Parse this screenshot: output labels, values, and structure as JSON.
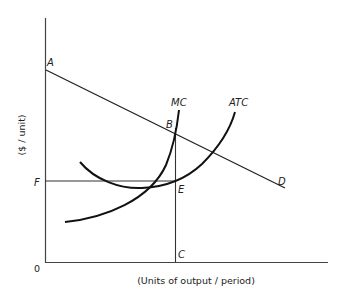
{
  "diagram": {
    "type": "economics-cost-curves",
    "y_axis_label": "($ / unit)",
    "x_axis_label": "(Units of output / period)",
    "origin_label": "0",
    "curves": {
      "demand": {
        "start_label": "A",
        "end_label": "D"
      },
      "mc": {
        "label": "MC"
      },
      "atc": {
        "label": "ATC"
      }
    },
    "points": {
      "A": "A",
      "B": "B",
      "C": "C",
      "D": "D",
      "E": "E",
      "F": "F"
    },
    "colors": {
      "line": "#222222",
      "background": "#ffffff"
    }
  }
}
